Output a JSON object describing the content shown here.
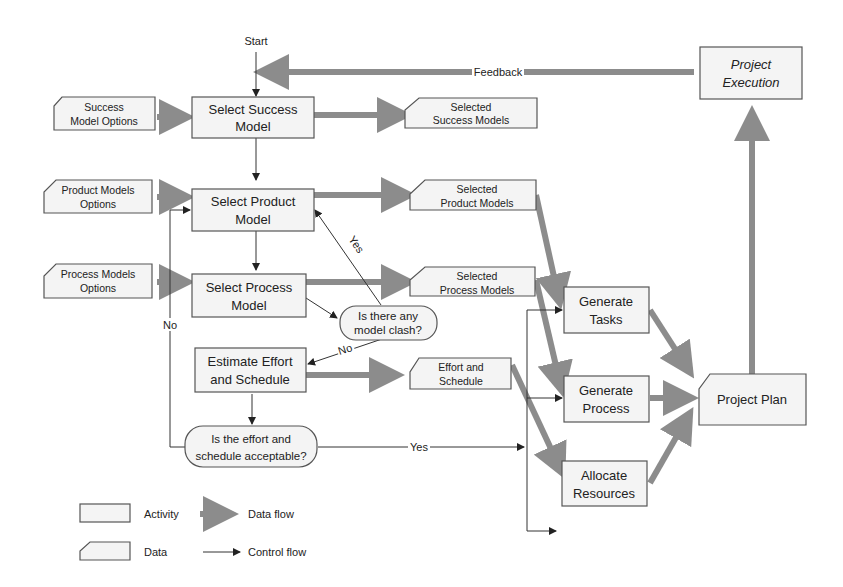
{
  "diagram": {
    "start_label": "Start",
    "feedback_label": "Feedback",
    "activities": {
      "select_success": [
        "Select Success",
        "Model"
      ],
      "select_product": [
        "Select Product",
        "Model"
      ],
      "select_process": [
        "Select Process",
        "Model"
      ],
      "estimate": [
        "Estimate Effort",
        "and Schedule"
      ],
      "gen_tasks": [
        "Generate",
        "Tasks"
      ],
      "gen_process": [
        "Generate",
        "Process"
      ],
      "allocate": [
        "Allocate",
        "Resources"
      ],
      "execution": [
        "Project",
        "Execution"
      ]
    },
    "data": {
      "success_opts": [
        "Success",
        "Model Options"
      ],
      "product_opts": [
        "Product Models",
        "Options"
      ],
      "process_opts": [
        "Process Models",
        "Options"
      ],
      "sel_success": [
        "Selected",
        "Success Models"
      ],
      "sel_product": [
        "Selected",
        "Product Models"
      ],
      "sel_process": [
        "Selected",
        "Process Models"
      ],
      "effort": [
        "Effort and",
        "Schedule"
      ],
      "plan": [
        "Project Plan"
      ]
    },
    "decisions": {
      "clash": [
        "Is there any",
        "model clash?"
      ],
      "acceptable": [
        "Is the effort and",
        "schedule acceptable?"
      ]
    },
    "edge_labels": {
      "yes_clash": "Yes",
      "no_clash": "No",
      "yes_accept": "Yes",
      "no_accept": "No"
    }
  },
  "legend": {
    "activity": "Activity",
    "data": "Data",
    "data_flow": "Data flow",
    "control_flow": "Control flow"
  }
}
